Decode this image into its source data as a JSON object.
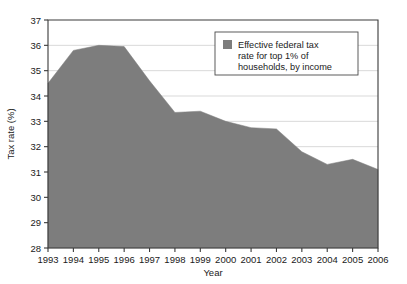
{
  "chart_data": {
    "type": "area",
    "title": "",
    "xlabel": "Year",
    "ylabel": "Tax rate (%)",
    "categories": [
      1993,
      1994,
      1995,
      1996,
      1997,
      1998,
      1999,
      2000,
      2001,
      2002,
      2003,
      2004,
      2005,
      2006
    ],
    "x_tick_labels": [
      "1993",
      "1994",
      "1995",
      "1996",
      "1997",
      "1998",
      "1999",
      "2000",
      "2001",
      "2002",
      "2003",
      "2004",
      "2005",
      "2006"
    ],
    "y_tick_labels": [
      "28",
      "29",
      "30",
      "31",
      "32",
      "33",
      "34",
      "35",
      "36",
      "37"
    ],
    "y_ticks": [
      28,
      29,
      30,
      31,
      32,
      33,
      34,
      35,
      36,
      37
    ],
    "ylim": [
      28,
      37
    ],
    "xlim": [
      1993,
      2006
    ],
    "grid": true,
    "grid_axis": "y",
    "legend_position": "top-right",
    "series": [
      {
        "name": "Effective federal tax rate for top 1% of households, by income",
        "color": "#7d7d7d",
        "values": [
          34.5,
          35.8,
          36.0,
          35.95,
          34.6,
          33.35,
          33.4,
          33.0,
          32.75,
          32.7,
          31.8,
          31.3,
          31.5,
          31.1
        ]
      }
    ]
  },
  "legend": {
    "line1": "Effective federal tax",
    "line2": "rate for top 1% of",
    "line3": "households, by income",
    "swatch_color": "#7d7d7d"
  },
  "axes": {
    "x_title": "Year",
    "y_title": "Tax rate (%)"
  },
  "colors": {
    "area_fill": "#7d7d7d",
    "grid": "#c9c9c9",
    "frame": "#3a3a3a",
    "background": "#ffffff",
    "text": "#1a1a1a"
  }
}
